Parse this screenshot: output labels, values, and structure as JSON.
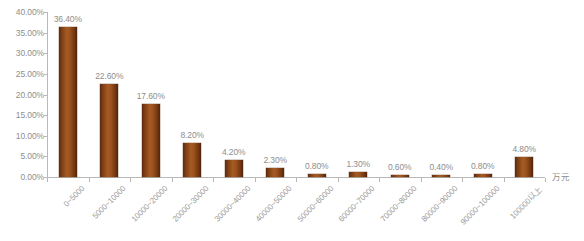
{
  "chart_data": {
    "type": "bar",
    "title": "",
    "xlabel": "万元",
    "ylabel": "",
    "grid": false,
    "legend": "none",
    "ylim": [
      0,
      40
    ],
    "ytick_labels": [
      "0.00%",
      "5.00%",
      "10.00%",
      "15.00%",
      "20.00%",
      "25.00%",
      "30.00%",
      "35.00%",
      "40.00%"
    ],
    "ytick_values": [
      0,
      5,
      10,
      15,
      20,
      25,
      30,
      35,
      40
    ],
    "categories": [
      "0~5000",
      "5000~10000",
      "10000~20000",
      "20000~30000",
      "30000~40000",
      "40000~50000",
      "50000~60000",
      "60000~70000",
      "70000~80000",
      "80000~90000",
      "90000~100000",
      "100000以上"
    ],
    "values": [
      36.4,
      22.6,
      17.6,
      8.2,
      4.2,
      2.3,
      0.8,
      1.3,
      0.6,
      0.4,
      0.8,
      4.8
    ],
    "data_labels": [
      "36.40%",
      "22.60%",
      "17.60%",
      "8.20%",
      "4.20%",
      "2.30%",
      "0.80%",
      "1.30%",
      "0.60%",
      "0.40%",
      "0.80%",
      "4.80%"
    ],
    "colors": {
      "bar": "#8b4513",
      "bar_dark": "#5a2a10",
      "bar_light": "#a55a22",
      "axis": "#b9b9b9",
      "tick_text": "#8e8e8e",
      "category_text": "#9a9a9a",
      "background": "#ffffff"
    }
  }
}
